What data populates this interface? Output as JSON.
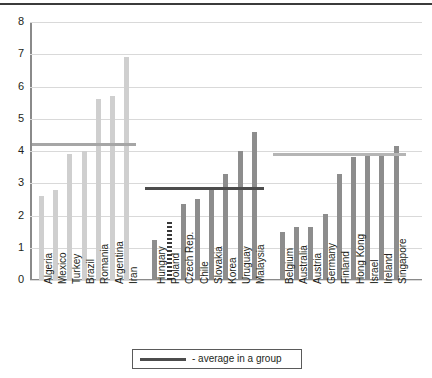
{
  "chart_data": {
    "type": "bar",
    "title": "",
    "subtitle": "",
    "xlabel": "",
    "ylabel": "",
    "ylim": [
      0,
      8
    ],
    "ytick_labels": [
      "0",
      "1",
      "2",
      "3",
      "4",
      "5",
      "6",
      "7",
      "8"
    ],
    "ytick_values": [
      0,
      1,
      2,
      3,
      4,
      5,
      6,
      7,
      8
    ],
    "grid": true,
    "legend_position": "bottom",
    "legend": [
      {
        "label": "- average in a group",
        "marker": "line",
        "color": "#4c4c4c"
      }
    ],
    "groups": [
      {
        "name": "group-1",
        "color": "#cfcfcf",
        "average": 4.2,
        "average_color": "#a6a6a6",
        "categories": [
          "Algeria",
          "Mexico",
          "Turkey",
          "Brazil",
          "Romania",
          "Argentina",
          "Iran"
        ],
        "values": [
          2.6,
          2.8,
          3.9,
          4.0,
          5.6,
          5.7,
          6.9
        ]
      },
      {
        "name": "group-2",
        "color": "#8d8d8d",
        "average": 2.85,
        "average_color": "#4c4c4c",
        "categories": [
          "Hungary",
          "Poland",
          "Czech Rep.",
          "Chile",
          "Slovakia",
          "Korea",
          "Uruguay",
          "Malaysia"
        ],
        "values": [
          1.25,
          1.8,
          2.35,
          2.5,
          2.8,
          3.3,
          4.0,
          4.6
        ],
        "highlight_index": 1,
        "highlight_style": "hatched"
      },
      {
        "name": "group-3",
        "color": "#8d8d8d",
        "average": 3.9,
        "average_color": "#b5b5b5",
        "categories": [
          "Belgium",
          "Australia",
          "Austria",
          "Germany",
          "Finland",
          "Hong Kong",
          "Israel",
          "Ireland",
          "Singapore"
        ],
        "values": [
          1.5,
          1.65,
          1.65,
          2.05,
          3.3,
          3.8,
          3.9,
          3.9,
          4.15
        ]
      }
    ]
  }
}
